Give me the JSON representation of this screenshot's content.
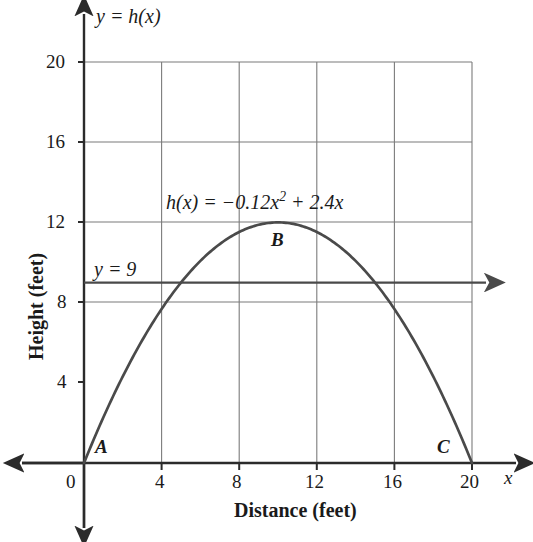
{
  "chart_data": {
    "type": "line",
    "title": "",
    "xlabel": "Distance (feet)",
    "ylabel": "Height (feet)",
    "xlim": [
      0,
      20
    ],
    "ylim": [
      0,
      20
    ],
    "grid": true,
    "legend_position": "none",
    "x_ticks": [
      "0",
      "4",
      "8",
      "12",
      "16",
      "20"
    ],
    "x_tick_values": [
      0,
      4,
      8,
      12,
      16,
      20
    ],
    "y_ticks": [
      "4",
      "8",
      "12",
      "16",
      "20"
    ],
    "y_tick_values": [
      4,
      8,
      12,
      16,
      20
    ],
    "series": [
      {
        "name": "h(x) = -0.12x^2 + 2.4x",
        "type": "parabola",
        "equation_text": "h(x) = −0.12x² + 2.4x",
        "coefficients": {
          "a": -0.12,
          "b": 2.4,
          "c": 0
        },
        "x": [
          0,
          1,
          2,
          3,
          4,
          5,
          6,
          7,
          8,
          9,
          10,
          11,
          12,
          13,
          14,
          15,
          16,
          17,
          18,
          19,
          20
        ],
        "values": [
          0,
          2.28,
          4.32,
          6.12,
          7.68,
          9,
          10.08,
          10.92,
          11.52,
          11.88,
          12,
          11.88,
          11.52,
          10.92,
          10.08,
          9,
          7.68,
          6.12,
          4.32,
          2.28,
          0
        ],
        "vertex": {
          "x": 10,
          "y": 12
        },
        "roots": [
          0,
          20
        ]
      },
      {
        "name": "y = 9",
        "type": "horizontal-line",
        "equation_text": "y = 9",
        "y_value": 9,
        "x_start": 0,
        "x_end": 20,
        "arrow_end": "right"
      }
    ],
    "annotations": [
      {
        "label": "A",
        "x": 0,
        "y": 0,
        "note": "left root of parabola"
      },
      {
        "label": "B",
        "x": 10,
        "y": 12,
        "note": "vertex of parabola"
      },
      {
        "label": "C",
        "x": 20,
        "y": 0,
        "note": "right root of parabola"
      }
    ],
    "intersections": [
      {
        "x": 5,
        "y": 9
      },
      {
        "x": 15,
        "y": 9
      }
    ]
  },
  "labels": {
    "y_axis_function_label": "y = h(x)",
    "y_axis_function_label_var": "y",
    "y_axis_function_label_eq": "=",
    "y_axis_function_label_fn": "h(x)",
    "equation": "h(x) = −0.12x² + 2.4x",
    "equation_lhs": "h(x) =",
    "equation_coef": "−0.12",
    "equation_x": "x",
    "equation_exp": "2",
    "equation_rhs": "+ 2.4x",
    "horizontal_line_label": "y = 9",
    "point_a": "A",
    "point_b": "B",
    "point_c": "C",
    "x_axis_variable": "x",
    "x_axis_title": "Distance (feet)",
    "y_axis_title": "Height (feet)"
  },
  "colors": {
    "curve": "#4a4a4a",
    "grid": "#7a7a7a",
    "axis": "#1a1a1a",
    "text": "#1a1a1a",
    "background": "#ffffff"
  }
}
